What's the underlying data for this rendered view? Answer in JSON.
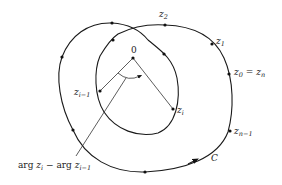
{
  "diagram": {
    "origin_label": "0",
    "curve_label": "C",
    "points": [
      {
        "id": "z2",
        "base": "z",
        "sub": "2"
      },
      {
        "id": "z1",
        "base": "z",
        "sub": "1"
      },
      {
        "id": "z0",
        "base": "z",
        "sub": "0",
        "eq": "= ",
        "eq_base": "z",
        "eq_sub": "n"
      },
      {
        "id": "zi-1",
        "base": "z",
        "sub": "i−1"
      },
      {
        "id": "zi",
        "base": "z",
        "sub": "i"
      },
      {
        "id": "zn-1",
        "base": "z",
        "sub": "n−1"
      }
    ],
    "annotation": {
      "arg1": "arg ",
      "z1": "z",
      "s1": "i",
      "minus": " − arg ",
      "z2": "z",
      "s2": "i−1"
    },
    "stroke_color": "#1a1a1a",
    "background": "#ffffff"
  }
}
